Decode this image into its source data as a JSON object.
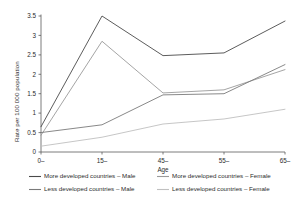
{
  "chart_data": {
    "type": "line",
    "title": "",
    "xlabel": "Age",
    "ylabel": "Rate per 100 000 population",
    "categories": [
      "0–",
      "15–",
      "45–",
      "55–",
      "65–"
    ],
    "x_ticks": [
      "0–",
      "15–",
      "45–",
      "55–",
      "65–"
    ],
    "y_ticks": [
      "0",
      "0.5",
      "1",
      "1.5",
      "2",
      "2.5",
      "3",
      "3.5"
    ],
    "y_tick_values": [
      0,
      0.5,
      1,
      1.5,
      2,
      2.5,
      3,
      3.5
    ],
    "ylim": [
      0,
      3.5
    ],
    "grid": false,
    "legend_position": "bottom",
    "series": [
      {
        "name": "More developed countries – Male",
        "color": "#4a4a4a",
        "values": [
          0.65,
          3.5,
          2.48,
          2.55,
          3.37
        ]
      },
      {
        "name": "More developed countries – Female",
        "color": "#9a9a9a",
        "values": [
          0.43,
          2.85,
          1.52,
          1.6,
          2.12
        ]
      },
      {
        "name": "Less developed countries – Male",
        "color": "#7a7a7a",
        "values": [
          0.5,
          0.7,
          1.47,
          1.5,
          2.25
        ]
      },
      {
        "name": "Less developed countries – Female",
        "color": "#c0c0c0",
        "values": [
          0.15,
          0.38,
          0.72,
          0.85,
          1.1
        ]
      }
    ]
  },
  "legend": {
    "entries": [
      "More developed countries – Male",
      "More developed countries – Female",
      "Less developed countries – Male",
      "Less developed countries – Female"
    ]
  }
}
